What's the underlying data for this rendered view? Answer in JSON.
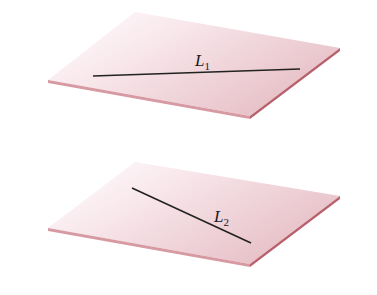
{
  "figure": {
    "colors": {
      "plane_fill_light": "#fbf1f3",
      "plane_fill_dark": "#e8c3c9",
      "plane_edge": "#c47d87",
      "line": "#222222"
    },
    "planes": [
      {
        "name": "top-plane",
        "line": {
          "label": "L",
          "subscript": "1"
        }
      },
      {
        "name": "bottom-plane",
        "line": {
          "label": "L",
          "subscript": "2"
        }
      }
    ]
  }
}
